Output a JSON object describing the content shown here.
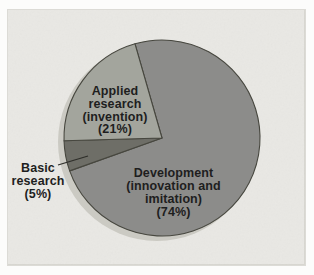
{
  "chart_data": {
    "type": "pie",
    "title": "",
    "legend": "none",
    "labels_on_chart": true,
    "direction": "clockwise",
    "start_angle_deg": 344,
    "center": {
      "x": 162,
      "y": 138
    },
    "radius": 98,
    "slices": [
      {
        "id": "development",
        "label": "Development (innovation and imitation)",
        "value_pct": 74,
        "color": "#8c8c8a"
      },
      {
        "id": "basic",
        "label": "Basic research",
        "value_pct": 5,
        "color": "#6e6e67"
      },
      {
        "id": "applied",
        "label": "Applied research (invention)",
        "value_pct": 21,
        "color": "#a3a59d"
      }
    ],
    "rim_shadow": {
      "dx": -5,
      "dy": 4,
      "color": "#cbcac3"
    },
    "outline": {
      "color": "#47473f",
      "width": 1.1
    },
    "leader_line": {
      "x1": 58,
      "y1": 165,
      "x2": 88,
      "y2": 156,
      "color": "#2e2e2a",
      "width": 1.3
    }
  },
  "labels": {
    "applied": {
      "lines": [
        "Applied",
        "research",
        "(invention)",
        "(21%)"
      ]
    },
    "basic": {
      "lines": [
        "Basic",
        "research",
        "(5%)"
      ]
    },
    "development": {
      "lines": [
        "Development",
        "(innovation and",
        "imitation)",
        "(74%)"
      ]
    }
  },
  "colors": {
    "page_margin": "#fcfcfb",
    "panel_background": "#e9e8e4",
    "panel_edge": "#d8d7d1",
    "text": "#1e1e1e"
  }
}
